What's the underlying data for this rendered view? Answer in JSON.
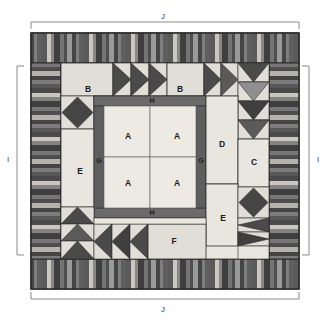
{
  "diagram": {
    "dimension_labels": {
      "top": "J",
      "bottom": "J",
      "left": "I",
      "right": "I"
    },
    "piece_labels": [
      {
        "id": "A",
        "text": "A",
        "x": 128,
        "y": 137
      },
      {
        "id": "A",
        "text": "A",
        "x": 177,
        "y": 137
      },
      {
        "id": "A",
        "text": "A",
        "x": 128,
        "y": 184
      },
      {
        "id": "A",
        "text": "A",
        "x": 177,
        "y": 184
      },
      {
        "id": "B",
        "text": "B",
        "x": 88,
        "y": 89
      },
      {
        "id": "B",
        "text": "B",
        "x": 180,
        "y": 89
      },
      {
        "id": "C",
        "text": "C",
        "x": 259,
        "y": 163
      },
      {
        "id": "D",
        "text": "D",
        "x": 222,
        "y": 145
      },
      {
        "id": "E",
        "text": "E",
        "x": 80,
        "y": 172
      },
      {
        "id": "E",
        "text": "E",
        "x": 223,
        "y": 219
      },
      {
        "id": "F",
        "text": "F",
        "x": 174,
        "y": 235
      },
      {
        "id": "G",
        "text": "G",
        "x": 99,
        "y": 161
      },
      {
        "id": "G",
        "text": "G",
        "x": 206,
        "y": 161
      },
      {
        "id": "H",
        "text": "H",
        "x": 152,
        "y": 106
      },
      {
        "id": "H",
        "text": "H",
        "x": 152,
        "y": 215
      }
    ],
    "colors": {
      "background": "#ffffff",
      "light_cream": "#e8e6de",
      "pale": "#dedcd4",
      "mid_gray": "#6e6e6e",
      "dark_gray": "#4a4a4a",
      "darker_gray": "#3c3c3c",
      "charcoal": "#555555",
      "light_stripe": "#c9c7bf",
      "outline": "#2b2b2b",
      "bracket": "#8a8a8a",
      "label_text": "#3a3a3a"
    },
    "components": {
      "center_block": "four A squares with G side sashing and H top/bottom sashing",
      "top_border": "vertical strip-pieced stripe band",
      "bottom_border": "vertical strip-pieced stripe band",
      "left_border": "horizontal strip-pieced stripe band",
      "right_border": "horizontal strip-pieced stripe band",
      "flying_geese_top": 3,
      "flying_geese_top_right": 2,
      "flying_geese_right_down": 4,
      "flying_geese_bottom_left_up": 3,
      "flying_geese_bottom_left": 3,
      "diamond_blocks": 2
    }
  }
}
